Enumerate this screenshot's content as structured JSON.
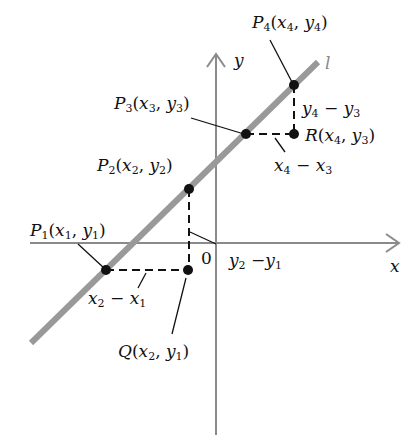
{
  "diagram": {
    "axes": {
      "x_label": "x",
      "y_label": "y",
      "origin_label": "0",
      "axis_color": "#8a8a8a"
    },
    "line": {
      "label": "l",
      "color": "#999999"
    },
    "points": {
      "P1": {
        "name": "P",
        "sub": "1",
        "coords": [
          "x",
          "1",
          "y",
          "1"
        ]
      },
      "P2": {
        "name": "P",
        "sub": "2",
        "coords": [
          "x",
          "2",
          "y",
          "2"
        ]
      },
      "P3": {
        "name": "P",
        "sub": "3",
        "coords": [
          "x",
          "3",
          "y",
          "3"
        ]
      },
      "P4": {
        "name": "P",
        "sub": "4",
        "coords": [
          "x",
          "4",
          "y",
          "4"
        ]
      },
      "Q": {
        "name": "Q",
        "coords": [
          "x",
          "2",
          "y",
          "1"
        ]
      },
      "R": {
        "name": "R",
        "coords": [
          "x",
          "4",
          "y",
          "3"
        ]
      }
    },
    "differences": {
      "run1": {
        "a": "x",
        "a_sub": "2",
        "op": "−",
        "b": "x",
        "b_sub": "1"
      },
      "rise1": {
        "a": "y",
        "a_sub": "2",
        "op": "−",
        "b": "y",
        "b_sub": "1"
      },
      "run2": {
        "a": "x",
        "a_sub": "4",
        "op": "−",
        "b": "x",
        "b_sub": "3"
      },
      "rise2": {
        "a": "y",
        "a_sub": "4",
        "op": "−",
        "b": "y",
        "b_sub": "3"
      }
    }
  }
}
